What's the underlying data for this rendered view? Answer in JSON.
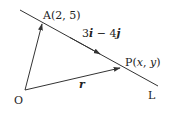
{
  "diagram": {
    "title": "",
    "colors": {
      "line": "#333333",
      "text": "#222222",
      "background": "#ffffff"
    },
    "points": {
      "O": {
        "label": "O"
      },
      "A": {
        "label_prefix": "A(",
        "coords": "2, 5",
        "label_suffix": ")"
      },
      "P": {
        "label_prefix": "P(",
        "x": "x",
        "sep": ", ",
        "y": "y",
        "label_suffix": ")"
      }
    },
    "line": {
      "label": "L"
    },
    "direction_vector": {
      "a": "3",
      "i": "i",
      "op": " − ",
      "b": "4",
      "j": "j"
    },
    "position_vector": {
      "label": "r"
    }
  }
}
